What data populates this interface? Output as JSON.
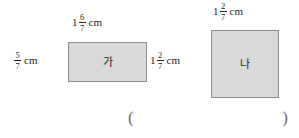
{
  "figure": {
    "type": "two-rectangles-with-dimension-labels",
    "shapes": [
      {
        "id": "ga",
        "label": "가",
        "fill_color": "#d9d9d9",
        "border_color": "#8c8c8c",
        "width_label": {
          "whole": "1",
          "numerator": "6",
          "denominator": "7",
          "unit": "cm"
        },
        "height_label": {
          "whole": "",
          "numerator": "5",
          "denominator": "7",
          "unit": "cm"
        }
      },
      {
        "id": "na",
        "label": "나",
        "fill_color": "#d9d9d9",
        "border_color": "#8c8c8c",
        "width_label": {
          "whole": "1",
          "numerator": "2",
          "denominator": "7",
          "unit": "cm"
        },
        "height_label": {
          "whole": "1",
          "numerator": "2",
          "denominator": "7",
          "unit": "cm"
        }
      }
    ]
  },
  "answer": {
    "open_paren": "(",
    "close_paren": ")",
    "value": ""
  }
}
